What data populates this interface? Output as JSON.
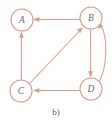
{
  "figure": {
    "caption": "b)",
    "kind": "directed-graph",
    "accent_color": "#de9b86",
    "label_color": "#6b6b6b",
    "background_color": "#ffffff"
  },
  "graph": {
    "nodes": [
      {
        "id": "A",
        "label": "A",
        "cx": 22,
        "cy": 20,
        "r": 11
      },
      {
        "id": "B",
        "label": "B",
        "cx": 91,
        "cy": 18,
        "r": 11
      },
      {
        "id": "C",
        "label": "C",
        "cx": 21,
        "cy": 91,
        "r": 11
      },
      {
        "id": "D",
        "label": "D",
        "cx": 91,
        "cy": 89,
        "r": 11
      }
    ],
    "edges": [
      {
        "id": "B-A",
        "from": "B",
        "to": "A",
        "shape": "straight",
        "direction": "left"
      },
      {
        "id": "C-A",
        "from": "C",
        "to": "A",
        "shape": "straight",
        "direction": "up"
      },
      {
        "id": "C-B",
        "from": "C",
        "to": "B",
        "shape": "straight",
        "direction": "up-right"
      },
      {
        "id": "B-D",
        "from": "B",
        "to": "D",
        "shape": "straight",
        "direction": "down"
      },
      {
        "id": "D-C",
        "from": "D",
        "to": "C",
        "shape": "straight",
        "direction": "left"
      },
      {
        "id": "D-B",
        "from": "D",
        "to": "B",
        "shape": "curved",
        "direction": "up"
      }
    ]
  }
}
